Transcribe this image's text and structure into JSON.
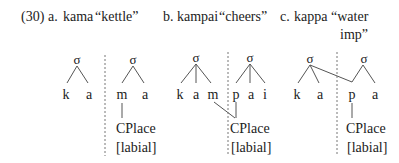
{
  "example": {
    "number": "(30)",
    "items": [
      {
        "letter": "a.",
        "word": "kama",
        "gloss": "“kettle”",
        "syllables": [
          {
            "node": "σ",
            "segments": [
              "k",
              "a"
            ]
          },
          {
            "node": "σ",
            "segments": [
              "m",
              "a"
            ]
          }
        ],
        "feature": {
          "label": "CPlace",
          "value": "[labial]"
        }
      },
      {
        "letter": "b.",
        "word": "kampai",
        "gloss": "“cheers”",
        "syllables": [
          {
            "node": "σ",
            "segments": [
              "k",
              "a",
              "m"
            ]
          },
          {
            "node": "σ",
            "segments": [
              "p",
              "a",
              "i"
            ]
          }
        ],
        "feature": {
          "label": "CPlace",
          "value": "[labial]"
        }
      },
      {
        "letter": "c.",
        "word": "kappa",
        "gloss_line1": "“water",
        "gloss_line2": "imp”",
        "syllables": [
          {
            "node": "σ",
            "segments": [
              "k",
              "a"
            ]
          },
          {
            "node": "σ",
            "segments": [
              "p",
              "a"
            ]
          }
        ],
        "feature": {
          "label": "CPlace",
          "value": "[labial]"
        }
      }
    ]
  },
  "colors": {
    "text": "#222222",
    "lines": "#555555",
    "dashed": "#777777"
  }
}
